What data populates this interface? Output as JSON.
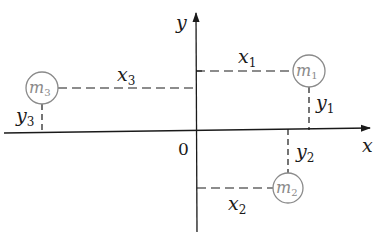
{
  "diagram": {
    "axes": {
      "x_label": "x",
      "y_label": "y",
      "origin_label": "0"
    },
    "masses": [
      {
        "name": "m",
        "sub": "1",
        "x_dist_label": "x",
        "x_dist_sub": "1",
        "y_dist_label": "y",
        "y_dist_sub": "1",
        "quadrant": "I"
      },
      {
        "name": "m",
        "sub": "2",
        "x_dist_label": "x",
        "x_dist_sub": "2",
        "y_dist_label": "y",
        "y_dist_sub": "2",
        "quadrant": "IV"
      },
      {
        "name": "m",
        "sub": "3",
        "x_dist_label": "x",
        "x_dist_sub": "3",
        "y_dist_label": "y",
        "y_dist_sub": "3",
        "quadrant": "II"
      }
    ],
    "colors": {
      "line": "#1a1a1a",
      "circle": "#8a8a8a"
    }
  }
}
